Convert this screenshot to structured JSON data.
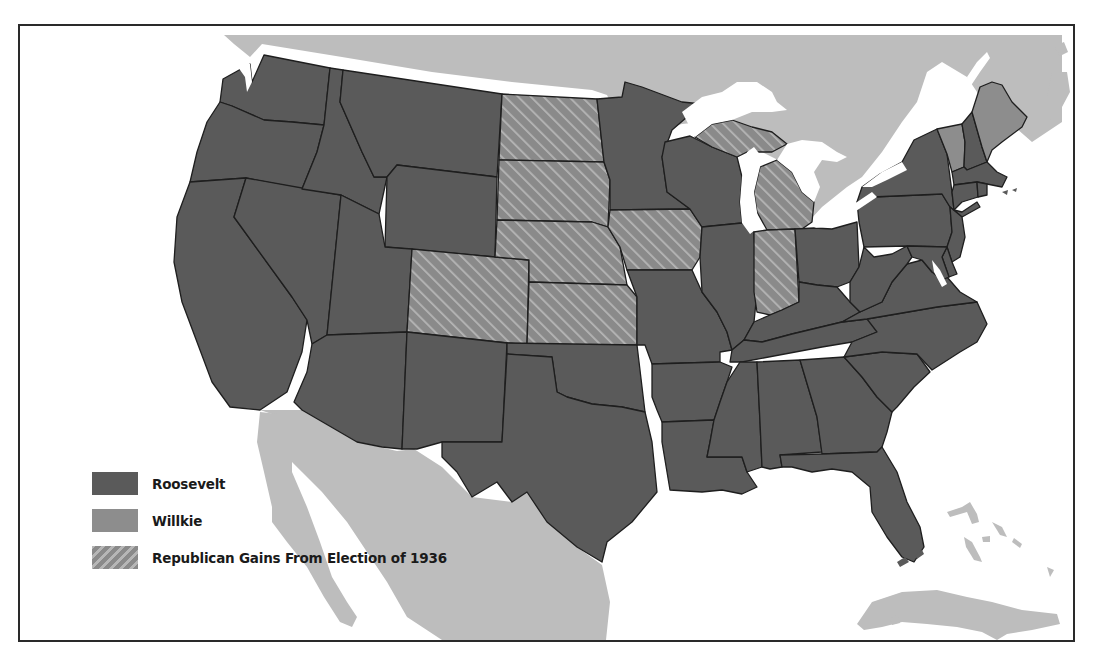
{
  "map": {
    "title": "Election of 1940",
    "colors": {
      "roosevelt": "#5a5a5a",
      "willkie": "#8d8d8d",
      "hatch_base": "#8a8a8a",
      "hatch_line": "#b4b4b4",
      "foreign_land": "#bdbdbd",
      "water": "#ffffff",
      "border": "#1e1e1e"
    },
    "legend": [
      {
        "key": "roosevelt",
        "label": "Roosevelt"
      },
      {
        "key": "willkie",
        "label": "Willkie"
      },
      {
        "key": "gains",
        "label": "Republican Gains From Election of 1936"
      }
    ],
    "states": {
      "roosevelt": [
        "WA",
        "OR",
        "CA",
        "NV",
        "ID",
        "MT",
        "WY",
        "UT",
        "AZ",
        "NM",
        "TX",
        "OK",
        "MN",
        "WI",
        "IL",
        "MO",
        "AR",
        "LA",
        "MS",
        "AL",
        "TN",
        "KY",
        "OH",
        "WV",
        "VA",
        "NC",
        "SC",
        "GA",
        "FL",
        "PA",
        "NY",
        "NJ",
        "DE",
        "MD",
        "CT",
        "RI",
        "MA",
        "NH"
      ],
      "willkie": [
        "ME",
        "VT"
      ],
      "republican_gains_1936": [
        "ND",
        "SD",
        "NE",
        "KS",
        "CO",
        "IA",
        "MI",
        "IN"
      ]
    },
    "regions_shown": [
      "United States",
      "Canada",
      "Mexico",
      "Cuba",
      "Bahamas"
    ]
  }
}
